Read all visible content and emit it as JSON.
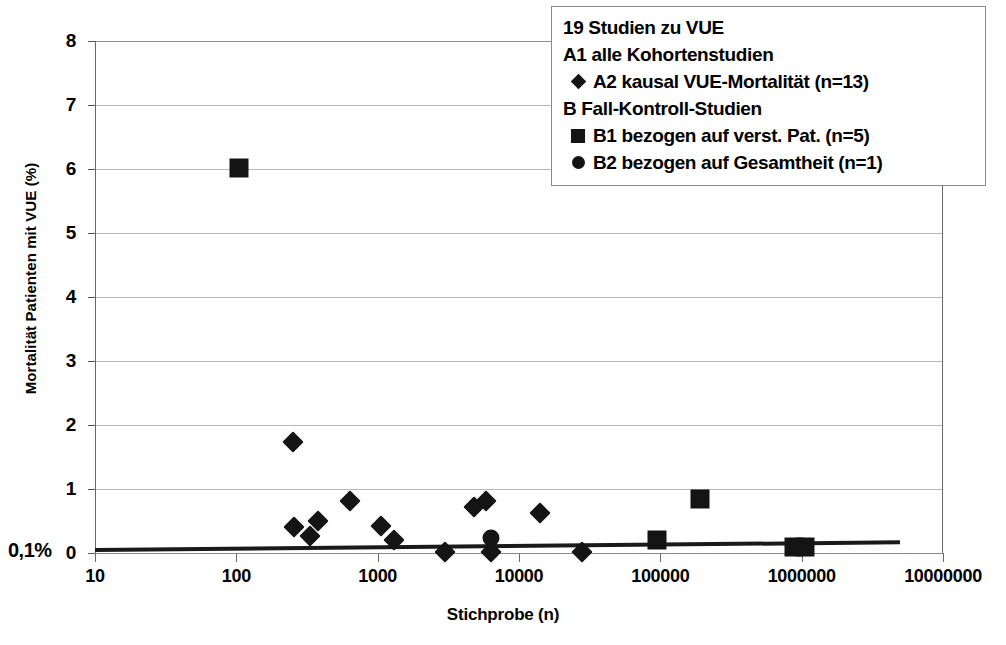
{
  "chart_data": {
    "type": "scatter",
    "title": "",
    "xlabel": "Stichprobe (n)",
    "ylabel": "Mortalität Patienten mit VUE (%)",
    "x_scale": "log",
    "xlim": [
      10,
      10000000
    ],
    "ylim": [
      0,
      8
    ],
    "grid": true,
    "legend_position": "top-right",
    "annotation": "0,1%",
    "xtick_labels": [
      "10",
      "100",
      "1000",
      "10000",
      "100000",
      "1000000",
      "10000000"
    ],
    "xtick_values": [
      10,
      100,
      1000,
      10000,
      100000,
      1000000,
      10000000
    ],
    "ytick_labels": [
      "0",
      "1",
      "2",
      "3",
      "4",
      "5",
      "6",
      "7",
      "8"
    ],
    "ytick_values": [
      0,
      1,
      2,
      3,
      4,
      5,
      6,
      7,
      8
    ],
    "series": [
      {
        "name": "A2 kausal VUE-Mortalität (n=13)",
        "marker": "diamond",
        "color": "#141414",
        "points": [
          {
            "x": 250,
            "y": 1.73
          },
          {
            "x": 255,
            "y": 0.4
          },
          {
            "x": 330,
            "y": 0.27
          },
          {
            "x": 380,
            "y": 0.5
          },
          {
            "x": 640,
            "y": 0.82
          },
          {
            "x": 1050,
            "y": 0.42
          },
          {
            "x": 1300,
            "y": 0.2
          },
          {
            "x": 3000,
            "y": 0.02
          },
          {
            "x": 4800,
            "y": 0.72
          },
          {
            "x": 5800,
            "y": 0.82
          },
          {
            "x": 6300,
            "y": 0.02
          },
          {
            "x": 14000,
            "y": 0.62
          },
          {
            "x": 28000,
            "y": 0.02
          }
        ]
      },
      {
        "name": "B1 bezogen auf verst. Pat. (n=5)",
        "marker": "square",
        "color": "#141414",
        "points": [
          {
            "x": 105,
            "y": 6.02
          },
          {
            "x": 95000,
            "y": 0.2
          },
          {
            "x": 190000,
            "y": 0.85
          },
          {
            "x": 880000,
            "y": 0.1
          },
          {
            "x": 1050000,
            "y": 0.1
          }
        ]
      },
      {
        "name": "B2 bezogen auf Gesamtheit (n=1)",
        "marker": "circle",
        "color": "#141414",
        "points": [
          {
            "x": 6300,
            "y": 0.24
          }
        ]
      }
    ],
    "trendline": {
      "x_start": 10,
      "x_end": 5000000,
      "y_start": 0.05,
      "y_end": 0.17
    }
  },
  "legend": {
    "rows": [
      {
        "symbol": "none",
        "label": "19 Studien zu VUE"
      },
      {
        "symbol": "none",
        "label": "A1 alle Kohortenstudien"
      },
      {
        "symbol": "diamond",
        "label": "A2 kausal VUE-Mortalität (n=13)"
      },
      {
        "symbol": "none",
        "label": "B Fall-Kontroll-Studien"
      },
      {
        "symbol": "square",
        "label": "B1 bezogen auf verst. Pat. (n=5)"
      },
      {
        "symbol": "circle",
        "label": "B2 bezogen auf Gesamtheit (n=1)"
      }
    ]
  }
}
